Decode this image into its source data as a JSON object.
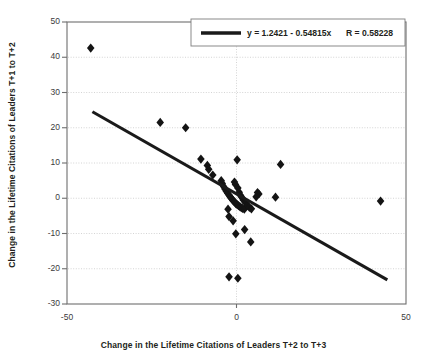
{
  "chart_data": {
    "type": "scatter",
    "title": "",
    "xlabel": "Change in the Lifetime Citations of Leaders T+2 to T+3",
    "ylabel": "Change in the Lifetime Citations of Leaders T+1 to T+2",
    "xlim": [
      -50,
      50
    ],
    "ylim": [
      -30,
      50
    ],
    "xticks": [
      "-50",
      "0",
      "50"
    ],
    "xtick_values": [
      -50,
      0,
      50
    ],
    "yticks": [
      "-30",
      "-20",
      "-10",
      "0",
      "10",
      "20",
      "30",
      "40",
      "50"
    ],
    "ytick_values": [
      -30,
      -20,
      -10,
      0,
      10,
      20,
      30,
      40,
      50
    ],
    "grid": true,
    "grid_axis": "both",
    "legend": {
      "position": "top-right",
      "equation": "y = 1.2421 - 0.54815x",
      "r_label": "R = 0.58228",
      "line_color": "#1a1a1a"
    },
    "fit_line": {
      "slope": -0.54815,
      "intercept": 1.2421,
      "r": 0.58228,
      "x_start": -42.5,
      "x_end": 44.5,
      "color": "#1a1a1a"
    },
    "marker": {
      "shape": "diamond",
      "color": "#141414",
      "size": 4.6
    },
    "points": [
      {
        "x": -43.0,
        "y": 42.6
      },
      {
        "x": -22.5,
        "y": 21.5
      },
      {
        "x": -15.0,
        "y": 20.0
      },
      {
        "x": -10.5,
        "y": 11.1
      },
      {
        "x": -8.6,
        "y": 9.3
      },
      {
        "x": -8.2,
        "y": 8.2
      },
      {
        "x": -7.0,
        "y": 6.6
      },
      {
        "x": -4.5,
        "y": 5.0
      },
      {
        "x": -4.2,
        "y": 4.2
      },
      {
        "x": -3.8,
        "y": 3.3
      },
      {
        "x": -3.4,
        "y": 2.6
      },
      {
        "x": -3.0,
        "y": 2.0
      },
      {
        "x": -2.6,
        "y": 1.4
      },
      {
        "x": -2.2,
        "y": 0.9
      },
      {
        "x": -1.9,
        "y": 0.4
      },
      {
        "x": -1.5,
        "y": 0.0
      },
      {
        "x": -1.2,
        "y": -0.4
      },
      {
        "x": -0.9,
        "y": -0.8
      },
      {
        "x": -0.5,
        "y": -1.1
      },
      {
        "x": -0.2,
        "y": -1.5
      },
      {
        "x": 0.2,
        "y": -1.8
      },
      {
        "x": 0.6,
        "y": -2.1
      },
      {
        "x": 1.0,
        "y": -2.4
      },
      {
        "x": 1.4,
        "y": -2.7
      },
      {
        "x": 1.8,
        "y": -2.9
      },
      {
        "x": 2.3,
        "y": -3.1
      },
      {
        "x": 0.2,
        "y": 10.9
      },
      {
        "x": -0.6,
        "y": 4.6
      },
      {
        "x": -0.3,
        "y": 3.9
      },
      {
        "x": 0.4,
        "y": 2.9
      },
      {
        "x": 0.8,
        "y": 1.7
      },
      {
        "x": 1.2,
        "y": 0.8
      },
      {
        "x": 1.6,
        "y": 0.2
      },
      {
        "x": 2.0,
        "y": -0.5
      },
      {
        "x": 2.6,
        "y": -1.2
      },
      {
        "x": 3.2,
        "y": -2.0
      },
      {
        "x": 3.8,
        "y": -2.6
      },
      {
        "x": 4.4,
        "y": -3.0
      },
      {
        "x": -2.5,
        "y": -3.1
      },
      {
        "x": -2.2,
        "y": -5.2
      },
      {
        "x": -1.0,
        "y": -6.4
      },
      {
        "x": -0.2,
        "y": -10.1
      },
      {
        "x": 2.4,
        "y": -8.9
      },
      {
        "x": 4.2,
        "y": -12.4
      },
      {
        "x": 6.2,
        "y": 1.6
      },
      {
        "x": 6.6,
        "y": 1.2
      },
      {
        "x": 5.8,
        "y": 0.4
      },
      {
        "x": 11.5,
        "y": 0.3
      },
      {
        "x": 13.0,
        "y": 9.6
      },
      {
        "x": 42.5,
        "y": -0.8
      },
      {
        "x": -2.2,
        "y": -22.3
      },
      {
        "x": 0.4,
        "y": -22.7
      }
    ]
  }
}
